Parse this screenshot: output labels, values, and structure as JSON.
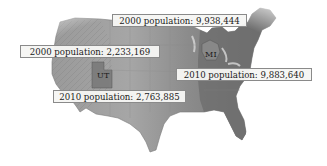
{
  "map": {
    "type": "choropleth-relief",
    "region": "Contiguous United States",
    "palette": {
      "west_relief": "#8f8f8f",
      "plains": "#a9a9a9",
      "east": "#6f6f6f",
      "highlight_state": "#7a7a7a",
      "background": "#ffffff",
      "label_fill": "#f6f6f4",
      "label_border": "#8a8a8a"
    },
    "states": [
      {
        "abbr": "UT",
        "label": "UT"
      },
      {
        "abbr": "MI",
        "label": "MI"
      }
    ],
    "callouts": [
      {
        "id": "mi-2000",
        "state": "MI",
        "text": "2000 population: 9,938,444",
        "year": 2000,
        "population": "9,938,444"
      },
      {
        "id": "ut-2000",
        "state": "UT",
        "text": "2000 population: 2,233,169",
        "year": 2000,
        "population": "2,233,169"
      },
      {
        "id": "mi-2010",
        "state": "MI",
        "text": "2010 population: 9,883,640",
        "year": 2010,
        "population": "9,883,640"
      },
      {
        "id": "ut-2010",
        "state": "UT",
        "text": "2010 population: 2,763,885",
        "year": 2010,
        "population": "2,763,885"
      }
    ]
  }
}
